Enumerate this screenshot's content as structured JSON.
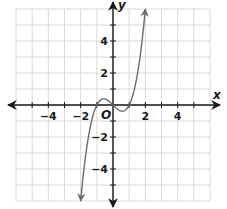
{
  "chart_data": {
    "type": "line",
    "title": "",
    "xlabel": "x",
    "ylabel": "y",
    "origin_label": "O",
    "xlim": [
      -6,
      6
    ],
    "ylim": [
      -6,
      6
    ],
    "grid": true,
    "grid_step": 1,
    "x_ticks": [
      -4,
      -2,
      2,
      4
    ],
    "y_ticks": [
      4,
      2,
      -2,
      -4
    ],
    "x_tick_labels": [
      "−4",
      "−2",
      "2",
      "4"
    ],
    "y_tick_labels": [
      "4",
      "2",
      "−2",
      "−4"
    ],
    "series": [
      {
        "name": "f(x) = x^3 - x",
        "function": "x^3 - x",
        "x_domain": [
          -2,
          2
        ],
        "arrows_at_ends": true,
        "points": [
          {
            "x": -2,
            "y": -6
          },
          {
            "x": -1.5,
            "y": -1.875
          },
          {
            "x": -1,
            "y": 0
          },
          {
            "x": -0.577,
            "y": 0.385
          },
          {
            "x": 0,
            "y": 0
          },
          {
            "x": 0.577,
            "y": -0.385
          },
          {
            "x": 1,
            "y": 0
          },
          {
            "x": 1.5,
            "y": 1.875
          },
          {
            "x": 2,
            "y": 6
          }
        ]
      }
    ]
  },
  "colors": {
    "grid": "#d9d9d9",
    "axis": "#1a1a1a",
    "curve": "#6b6b6b",
    "text": "#1a1a1a"
  }
}
